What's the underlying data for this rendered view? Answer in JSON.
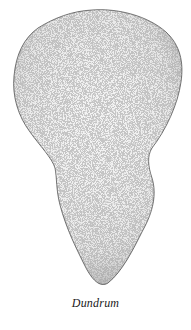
{
  "illustration": {
    "subject": "stippled outline shape",
    "caption": "Dundrum",
    "colors": {
      "background": "#ffffff",
      "fill": "#f1f1f1",
      "edge": "#3a3a3a",
      "stipple": "#8a8a8a"
    }
  }
}
